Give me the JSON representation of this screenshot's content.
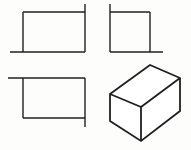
{
  "figure": {
    "background_color": "#fdfdfc",
    "line_color": "#201f1f",
    "face_color": "#ffffff",
    "canvas": {
      "width": 191,
      "height": 150
    },
    "views": [
      {
        "id": "top-left-view",
        "name": "front-view-rectangle",
        "label": "",
        "shape": "rectangle",
        "rect": {
          "x": 23,
          "y": 12,
          "width": 62,
          "height": 40
        },
        "overrun_edges": [
          {
            "edge": "right-vertical",
            "direction": "up",
            "length": 8
          },
          {
            "edge": "bottom-horizontal",
            "direction": "left",
            "length": 13
          }
        ],
        "polyline_points": "23,12 85,12",
        "stroke_width": 1.4
      },
      {
        "id": "top-right-view",
        "name": "side-view-square",
        "label": "",
        "shape": "square",
        "rect": {
          "x": 110,
          "y": 12,
          "width": 40,
          "height": 40
        },
        "overrun_edges": [
          {
            "edge": "left-vertical",
            "direction": "up",
            "length": 8
          },
          {
            "edge": "bottom-horizontal",
            "direction": "right",
            "length": 13
          }
        ],
        "stroke_width": 1.4
      },
      {
        "id": "bottom-left-view",
        "name": "top-view-rectangle",
        "label": "",
        "shape": "rectangle",
        "rect": {
          "x": 23,
          "y": 78,
          "width": 62,
          "height": 40
        },
        "overrun_edges": [
          {
            "edge": "top-horizontal",
            "direction": "left",
            "length": 15
          },
          {
            "edge": "right-vertical",
            "direction": "down",
            "length": 9
          }
        ],
        "stroke_width": 1.4
      },
      {
        "id": "bottom-right-view",
        "name": "isometric-box",
        "label": "",
        "shape": "isometric-rectangular-prism",
        "stroke_width": 1.8,
        "vertices": {
          "top_back_left": {
            "x": 110,
            "y": 94
          },
          "top_apex": {
            "x": 150,
            "y": 65
          },
          "top_right": {
            "x": 180,
            "y": 78
          },
          "top_front_center": {
            "x": 141,
            "y": 107
          },
          "bottom_left": {
            "x": 110,
            "y": 121
          },
          "bottom_front_center": {
            "x": 141,
            "y": 141
          },
          "bottom_right": {
            "x": 180,
            "y": 111
          }
        },
        "faces": [
          {
            "name": "top-face",
            "points": "110,94 150,65 180,78 141,107"
          },
          {
            "name": "left-face",
            "points": "110,94 141,107 141,141 110,121"
          },
          {
            "name": "right-face",
            "points": "141,107 180,78 180,111 141,141"
          }
        ]
      }
    ]
  }
}
